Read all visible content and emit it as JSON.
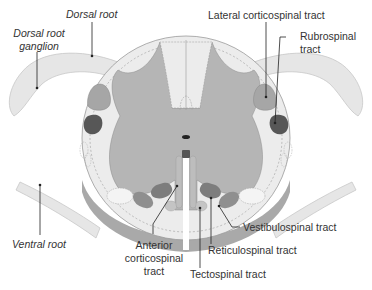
{
  "labels": {
    "dorsal_root": "Dorsal root",
    "dorsal_root_ganglion_1": "Dorsal root",
    "dorsal_root_ganglion_2": "ganglion",
    "lateral_corticospinal": "Lateral corticospinal tract",
    "rubrospinal_1": "Rubrospinal",
    "rubrospinal_2": "tract",
    "ventral_root": "Ventral root",
    "anterior_corticospinal_1": "Anterior",
    "anterior_corticospinal_2": "corticospinal",
    "anterior_corticospinal_3": "tract",
    "vestibulospinal": "Vestibulospinal tract",
    "reticulospinal": "Reticulospinal tract",
    "tectospinal": "Tectospinal tract"
  },
  "colors": {
    "white_matter": "#ececec",
    "gray_matter": "#b5b5b5",
    "cut_surface": "#a9a9a9",
    "root": "#e6e6e6",
    "lateral_corticospinal": "#a6a6a6",
    "rubrospinal": "#575757",
    "reticulospinal": "#7d7d7d",
    "vestibulospinal": "#8f8f8f",
    "tectospinal": "#c4c4c4",
    "anterior_corticospinal": "#bdbdbd",
    "leader_line": "#222222",
    "text": "#333333"
  }
}
